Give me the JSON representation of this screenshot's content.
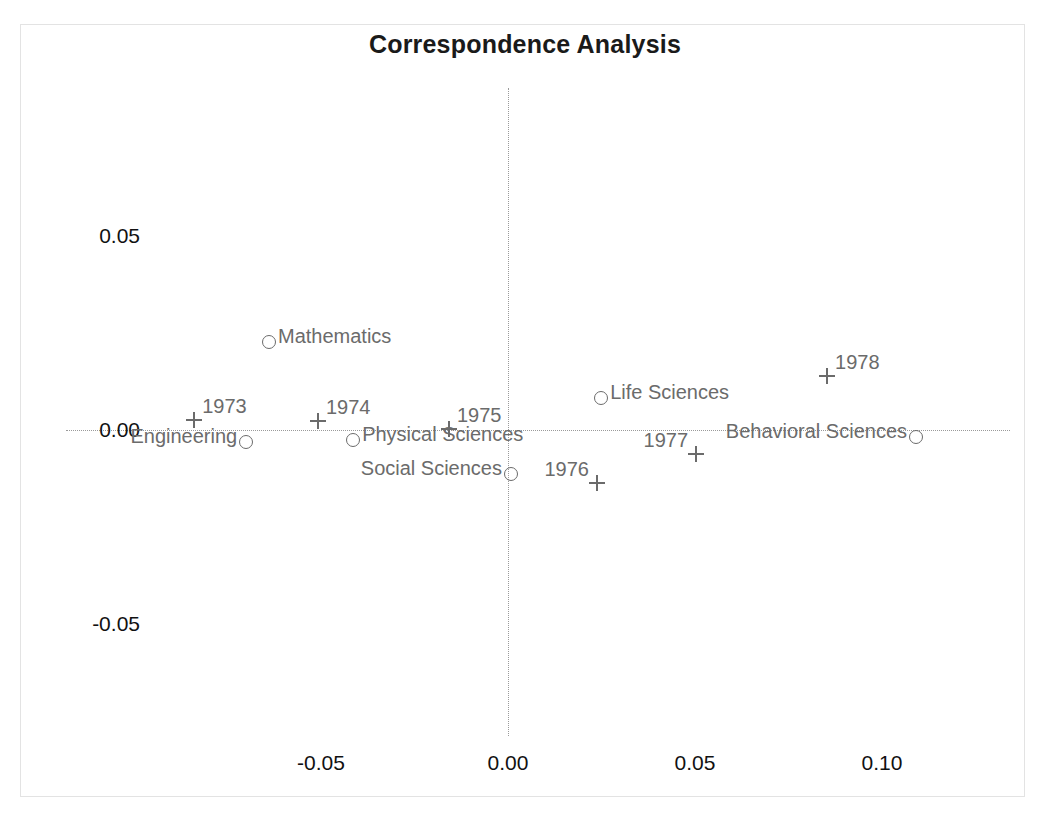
{
  "chart_data": {
    "type": "scatter",
    "title": "Correspondence Analysis",
    "xlabel": "",
    "ylabel": "",
    "xlim": [
      -0.085,
      0.1385
    ],
    "ylim": [
      -0.0945,
      0.0755
    ],
    "xticks": [
      "-0.05",
      "0.00",
      "0.05",
      "0.10"
    ],
    "xtick_values": [
      -0.05,
      0.0,
      0.05,
      0.1
    ],
    "yticks": [
      "0.05",
      "0.00",
      "-0.05"
    ],
    "ytick_values": [
      0.05,
      0.0,
      -0.05
    ],
    "grid": false,
    "legend": "none",
    "axis_lines": {
      "horizontal_at_y": 0.0,
      "vertical_at_x": 0.0,
      "style": "dotted",
      "color": "#9a9a9a"
    },
    "series": [
      {
        "name": "Fields (rows)",
        "marker": "circle",
        "color": "#6b6b6b",
        "points": [
          {
            "label": "Mathematics",
            "x": -0.0639,
            "y": 0.0227,
            "label_pos": "right"
          },
          {
            "label": "Engineering",
            "x": -0.07,
            "y": -0.0031,
            "label_pos": "left"
          },
          {
            "label": "Physical Sciences",
            "x": -0.0414,
            "y": -0.0026,
            "label_pos": "right"
          },
          {
            "label": "Social Sciences",
            "x": 0.0008,
            "y": -0.0113,
            "label_pos": "left"
          },
          {
            "label": "Life Sciences",
            "x": 0.0249,
            "y": 0.0082,
            "label_pos": "right"
          },
          {
            "label": "Behavioral Sciences",
            "x": 0.1091,
            "y": -0.0018,
            "label_pos": "left"
          }
        ]
      },
      {
        "name": "Years (columns)",
        "marker": "plus",
        "color": "#6b6b6b",
        "points": [
          {
            "label": "1973",
            "x": -0.0839,
            "y": 0.0026,
            "label_pos": "ne"
          },
          {
            "label": "1974",
            "x": -0.0508,
            "y": 0.0023,
            "label_pos": "ne"
          },
          {
            "label": "1975",
            "x": -0.0158,
            "y": 0.0003,
            "label_pos": "ne"
          },
          {
            "label": "1976",
            "x": 0.0238,
            "y": -0.0137,
            "label_pos": "nw"
          },
          {
            "label": "1977",
            "x": 0.0503,
            "y": -0.0062,
            "label_pos": "nw"
          },
          {
            "label": "1978",
            "x": 0.0853,
            "y": 0.0139,
            "label_pos": "ne"
          }
        ]
      }
    ]
  }
}
